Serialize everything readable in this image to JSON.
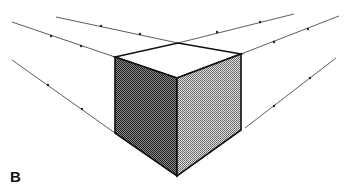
{
  "figure": {
    "label": "B",
    "colors": {
      "line": "#222222",
      "left_face": "#555555",
      "right_face": "#aaaaaa",
      "top_face": "#ffffff"
    }
  }
}
